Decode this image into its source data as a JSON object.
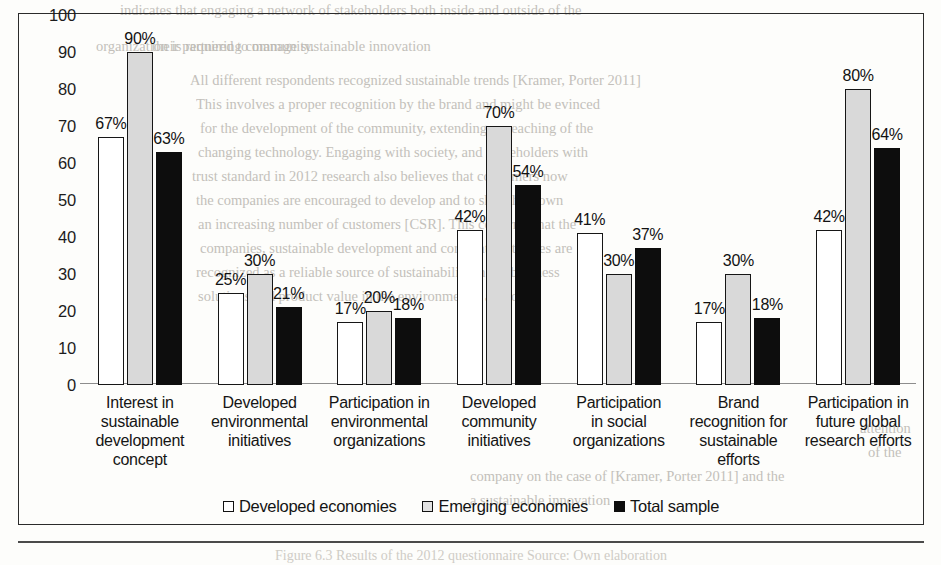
{
  "chart_data": {
    "type": "bar",
    "title": "",
    "xlabel": "",
    "ylabel": "",
    "ylim": [
      0,
      100
    ],
    "yticks": [
      100,
      90,
      80,
      70,
      60,
      50,
      40,
      30,
      20,
      10,
      0
    ],
    "grid": false,
    "legend_position": "bottom-center",
    "value_label_suffix": "%",
    "categories": [
      "Interest in sustainable development concept",
      "Developed environmental initiatives",
      "Participation in environmental organizations",
      "Developed community initiatives",
      "Participation in social organizations",
      "Brand recognition for sustainable efforts",
      "Participation in future global research efforts"
    ],
    "category_label_lines": [
      [
        "Interest in",
        "sustainable",
        "development",
        "concept"
      ],
      [
        "Developed",
        "environmental",
        "initiatives"
      ],
      [
        "Participation in",
        "environmental",
        "organizations"
      ],
      [
        "Developed",
        "community",
        "initiatives"
      ],
      [
        "Participation",
        "in social",
        "organizations"
      ],
      [
        "Brand",
        "recognition for",
        "sustainable",
        "efforts"
      ],
      [
        "Participation in",
        "future global",
        "research efforts"
      ]
    ],
    "series": [
      {
        "name": "Developed economies",
        "color": "#ffffff",
        "swatch": "open-square-swatch",
        "values": [
          67,
          25,
          17,
          42,
          41,
          17,
          42
        ],
        "labels": [
          "67%",
          "25%",
          "17%",
          "42%",
          "41%",
          "17%",
          "42%"
        ]
      },
      {
        "name": "Emerging economies",
        "color": "#d9d9d9",
        "swatch": "light-gray-square-swatch",
        "values": [
          90,
          30,
          20,
          70,
          30,
          30,
          80
        ],
        "labels": [
          "90%",
          "30%",
          "20%",
          "70%",
          "30%",
          "30%",
          "80%"
        ]
      },
      {
        "name": "Total sample",
        "color": "#0d0d0d",
        "swatch": "filled-square-swatch",
        "values": [
          63,
          21,
          18,
          54,
          37,
          18,
          64
        ],
        "labels": [
          "63%",
          "21%",
          "18%",
          "54%",
          "37%",
          "18%",
          "64%"
        ]
      }
    ]
  },
  "legend": {
    "items": [
      {
        "label": "Developed economies"
      },
      {
        "label": "Emerging economies"
      },
      {
        "label": "Total sample"
      }
    ]
  },
  "caption": {
    "text": "Figure 6.3  Results of the 2012 questionnaire Source: Own elaboration"
  },
  "page_bleed_lines": [
    {
      "text": "indicates that engaging a network of stakeholders both inside and outside of the",
      "x": 120,
      "y": 2
    },
    {
      "text": "organization is required to manage sustainable innovation",
      "x": 96,
      "y": 38
    },
    {
      "text": "their partnering community.",
      "x": 152,
      "y": 38
    },
    {
      "text": "All different respondents recognized sustainable trends [Kramer, Porter 2011]",
      "x": 190,
      "y": 72
    },
    {
      "text": "This involves a proper recognition by the brand and might be evinced",
      "x": 196,
      "y": 96
    },
    {
      "text": "for the development of the community, extending or reaching of the",
      "x": 200,
      "y": 120
    },
    {
      "text": "changing technology. Engaging with society, and stakeholders with",
      "x": 198,
      "y": 144
    },
    {
      "text": "trust standard in 2012 research also believes that consumers now",
      "x": 192,
      "y": 168
    },
    {
      "text": "the companies are encouraged to develop and to shift their own",
      "x": 196,
      "y": 192
    },
    {
      "text": "an increasing number of customers [CSR]. This confirms that the",
      "x": 198,
      "y": 216
    },
    {
      "text": "companies, sustainable development and corporate activities are",
      "x": 200,
      "y": 240
    },
    {
      "text": "recognized as a reliable source of sustainability in the business",
      "x": 196,
      "y": 264
    },
    {
      "text": "solutions and product value in the environmental approach",
      "x": 198,
      "y": 288
    },
    {
      "text": "attention",
      "x": 860,
      "y": 420
    },
    {
      "text": "of the",
      "x": 868,
      "y": 444
    },
    {
      "text": "company on the case of [Kramer, Porter 2011] and the",
      "x": 470,
      "y": 468
    },
    {
      "text": "a sustainable innovation",
      "x": 470,
      "y": 492
    }
  ]
}
